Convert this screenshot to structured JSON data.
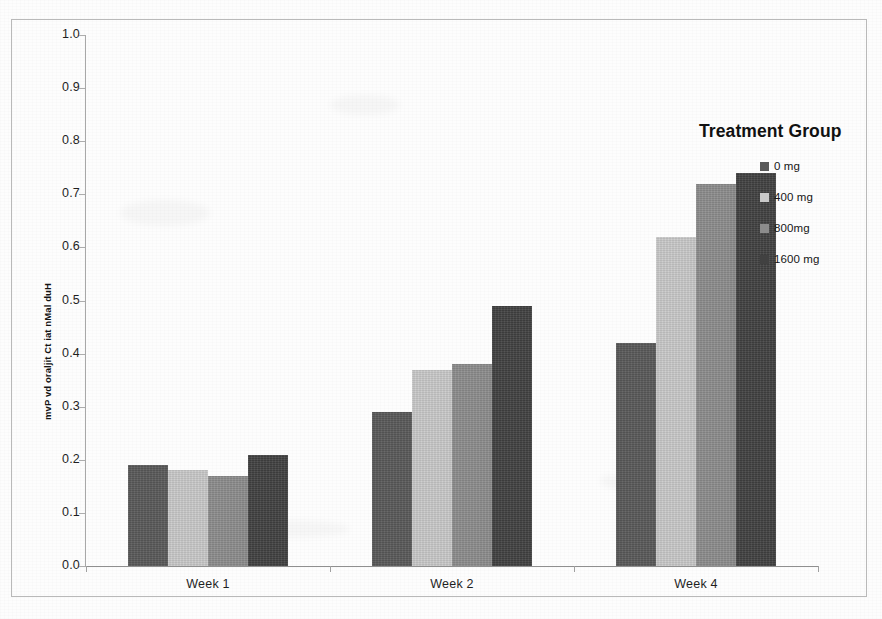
{
  "chart_data": {
    "type": "bar",
    "title": "",
    "subtitle": "",
    "xlabel": "",
    "ylabel": "mvP vd oraljit Ct iat nMal duH",
    "ylim": [
      0.0,
      1.0
    ],
    "ytick_labels": [
      "1.0",
      "0.9",
      "0.8",
      "0.7",
      "0.6",
      "0.5",
      "0.4",
      "0.3",
      "0.2",
      "0.1",
      "0.0"
    ],
    "ytick_values": [
      1.0,
      0.9,
      0.8,
      0.7,
      0.6,
      0.5,
      0.4,
      0.3,
      0.2,
      0.1,
      0.0
    ],
    "categories": [
      "Week 1",
      "Week 2",
      "Week 4"
    ],
    "grid": false,
    "legend_position": "right",
    "legend_title": "Treatment Group",
    "series": [
      {
        "name": "0 mg",
        "color": "#595959",
        "values": [
          0.19,
          0.29,
          0.42
        ]
      },
      {
        "name": "400 mg",
        "color": "#c9c9c9",
        "values": [
          0.18,
          0.37,
          0.62
        ]
      },
      {
        "name": "800mg",
        "color": "#8c8c8c",
        "values": [
          0.17,
          0.38,
          0.72
        ]
      },
      {
        "name": "1600 mg",
        "color": "#414141",
        "values": [
          0.21,
          0.49,
          0.74
        ]
      }
    ]
  },
  "legend": {
    "title": "Treatment Group",
    "items": [
      {
        "label": "0 mg",
        "color": "#595959"
      },
      {
        "label": "400 mg",
        "color": "#c9c9c9"
      },
      {
        "label": "800mg",
        "color": "#8c8c8c"
      },
      {
        "label": "1600 mg",
        "color": "#414141"
      }
    ]
  },
  "axes": {
    "y_title": "mvP vd oraljit Ct iat nMal duH",
    "y_ticks": [
      "1.0",
      "0.9",
      "0.8",
      "0.7",
      "0.6",
      "0.5",
      "0.4",
      "0.3",
      "0.2",
      "0.1",
      "0.0"
    ],
    "x_categories": [
      "Week 1",
      "Week 2",
      "Week 4"
    ]
  },
  "colors": {
    "axis": "#a0a0a0",
    "text": "#1a1a1a",
    "frame": "#b9b9b9",
    "page": "#fdfdfd"
  }
}
